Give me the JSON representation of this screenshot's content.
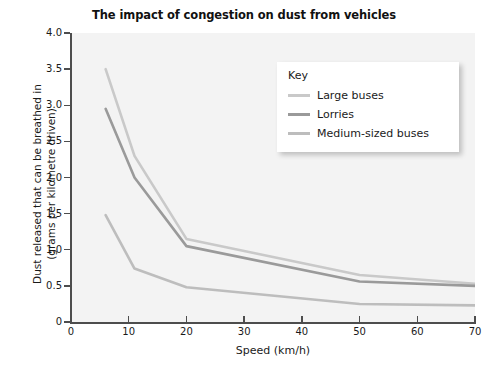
{
  "chart_data": {
    "type": "line",
    "title": "The impact of congestion on dust from vehicles",
    "xlabel": "Speed (km/h)",
    "ylabel_line1": "Dust released that can be breathed in",
    "ylabel_line2": "(grams per kilometre driven)",
    "xlim": [
      0,
      70
    ],
    "ylim": [
      0,
      4.0
    ],
    "grid": false,
    "legend_position": "top-right-inside",
    "legend_title": "Key",
    "x_ticks": [
      "0",
      "10",
      "20",
      "30",
      "40",
      "50",
      "60",
      "70"
    ],
    "x_tick_values": [
      0,
      10,
      20,
      30,
      40,
      50,
      60,
      70
    ],
    "y_ticks": [
      "0",
      "0.5",
      "1.0",
      "1.5",
      "2.0",
      "2.5",
      "3.0",
      "3.5",
      "4.0"
    ],
    "y_tick_values": [
      0,
      0.5,
      1.0,
      1.5,
      2.0,
      2.5,
      3.0,
      3.5,
      4.0
    ],
    "series": [
      {
        "name": "Large buses",
        "color": "#c9c9c9",
        "x": [
          6,
          11,
          20,
          50,
          70
        ],
        "values": [
          3.5,
          2.3,
          1.15,
          0.65,
          0.53
        ]
      },
      {
        "name": "Lorries",
        "color": "#9a9a9a",
        "x": [
          6,
          11,
          20,
          50,
          70
        ],
        "values": [
          2.95,
          2.0,
          1.05,
          0.56,
          0.5
        ]
      },
      {
        "name": "Medium-sized buses",
        "color": "#bdbdbd",
        "x": [
          6,
          11,
          20,
          50,
          70
        ],
        "values": [
          1.48,
          0.74,
          0.48,
          0.25,
          0.23
        ]
      }
    ]
  },
  "colors": {
    "plot_background": "#f3f3f3",
    "axis": "#4d4d4d",
    "text": "#1a1a1a",
    "legend_background": "#ffffff"
  }
}
